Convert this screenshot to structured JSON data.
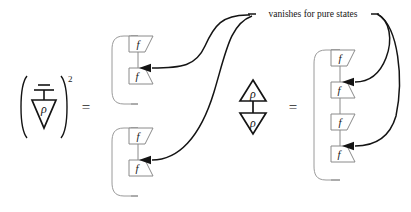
{
  "figure": {
    "background_color": "#ffffff",
    "ink_color": "#141414",
    "wire_color": "#8a8a8a",
    "annotation": {
      "text": "vanishes for pure states",
      "leader_count": 4
    },
    "operators": {
      "equals_1": "=",
      "equals_2": "=",
      "exponent": "2",
      "paren_open": "(",
      "paren_close": ")"
    },
    "left_term": {
      "name": "discard-on-rho-squared",
      "ground_symbol": "discard",
      "state_label": "ρ",
      "exponent": "2"
    },
    "middle_term": {
      "name": "rho-rho-pairing",
      "top_label": "ρ",
      "bottom_label": "ρ"
    },
    "left_expansion": {
      "name": "two-loop-pairs",
      "groups": [
        {
          "labels": [
            "f",
            "f"
          ]
        },
        {
          "labels": [
            "f",
            "f"
          ]
        }
      ]
    },
    "right_expansion": {
      "name": "single-loop-four-boxes",
      "labels": [
        "f",
        "f",
        "f",
        "f"
      ]
    }
  }
}
